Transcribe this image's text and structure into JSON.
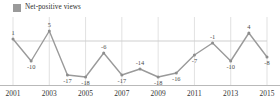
{
  "legend": {
    "label": "Net-positive views",
    "swatch_color": "#9a9a9a",
    "icon": "legend-square-icon"
  },
  "colors": {
    "line": "#9a9a9a",
    "marker": "#8d8d8d",
    "gridline": "#d9d9d9",
    "zero_line": "#cfcfcf",
    "axis": "#b9b9b9",
    "label_text": "#4a4a4a",
    "tick_text": "#333333"
  },
  "axis": {
    "tick_labels": [
      "2001",
      "2003",
      "2005",
      "2007",
      "2009",
      "2011",
      "2013",
      "2015"
    ]
  },
  "chart_data": {
    "type": "line",
    "title": "",
    "subtitle": "",
    "xlabel": "",
    "ylabel": "",
    "grid": true,
    "legend_position": "top-left",
    "ylim": [
      -20,
      8
    ],
    "x": [
      2001,
      2002,
      2003,
      2004,
      2005,
      2006,
      2007,
      2008,
      2009,
      2010,
      2011,
      2012,
      2013,
      2014,
      2015
    ],
    "categories": [
      "2001",
      "2002",
      "2003",
      "2004",
      "2005",
      "2006",
      "2007",
      "2008",
      "2009",
      "2010",
      "2011",
      "2012",
      "2013",
      "2014",
      "2015"
    ],
    "xtick_labels": [
      "2001",
      "2003",
      "2005",
      "2007",
      "2009",
      "2011",
      "2013",
      "2015"
    ],
    "series": [
      {
        "name": "Net-positive views",
        "values": [
          1,
          -10,
          5,
          -17,
          -18,
          -6,
          -17,
          -14,
          -18,
          -16,
          -7,
          -1,
          -10,
          4,
          -8
        ],
        "point_labels": [
          "1",
          "-10",
          "5",
          "-17",
          "-18",
          "-6",
          "-17",
          "-14",
          "-18",
          "-16",
          "-7",
          "-1",
          "-10",
          "4",
          "-8"
        ],
        "color": "#9a9a9a"
      }
    ]
  }
}
